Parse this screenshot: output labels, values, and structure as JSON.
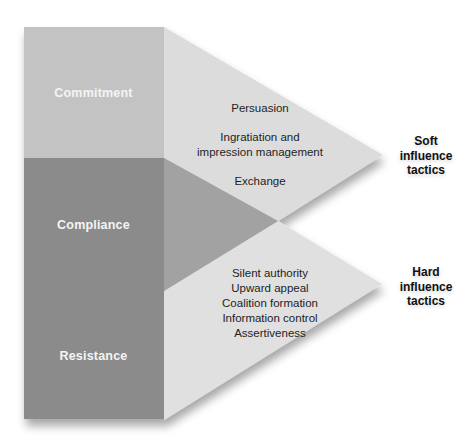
{
  "diagram": {
    "type": "influence-tactics-outcomes",
    "colors": {
      "background": "#ffffff",
      "commitment_column": "#c3c3c3",
      "lower_column": "#8b8b8b",
      "compliance_wedge": "#a2a2a2",
      "soft_triangle": "#dcdcdc",
      "hard_triangle": "#e0e0e0",
      "column_text": "#f4f4f4",
      "tactic_text": "#1e1e1e"
    },
    "outcomes": [
      {
        "label": "Commitment"
      },
      {
        "label": "Compliance"
      },
      {
        "label": "Resistance"
      }
    ],
    "soft": {
      "label_lines": [
        "Soft",
        "influence",
        "tactics"
      ],
      "tactics": [
        {
          "line1": "Persuasion"
        },
        {
          "line1": "Ingratiation and",
          "line2": "impression management"
        },
        {
          "line1": "Exchange"
        }
      ]
    },
    "hard": {
      "label_lines": [
        "Hard",
        "influence",
        "tactics"
      ],
      "tactics": [
        "Silent authority",
        "Upward appeal",
        "Coalition formation",
        "Information control",
        "Assertiveness"
      ]
    }
  }
}
